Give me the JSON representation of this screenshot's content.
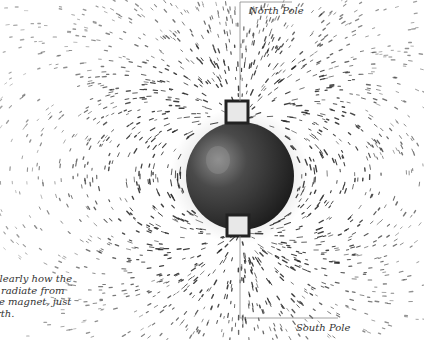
{
  "figure": {
    "labels": {
      "north": "North Pole",
      "south": "South Pole"
    },
    "caption_lines": [
      "clearly how the",
      "radiate from",
      "e magnet, just",
      "rth."
    ],
    "colors": {
      "background": "#ffffff",
      "sphere": "#3a3a3a",
      "filings": "#2b2b2b",
      "leader_line": "#888888",
      "text": "#333333"
    }
  }
}
